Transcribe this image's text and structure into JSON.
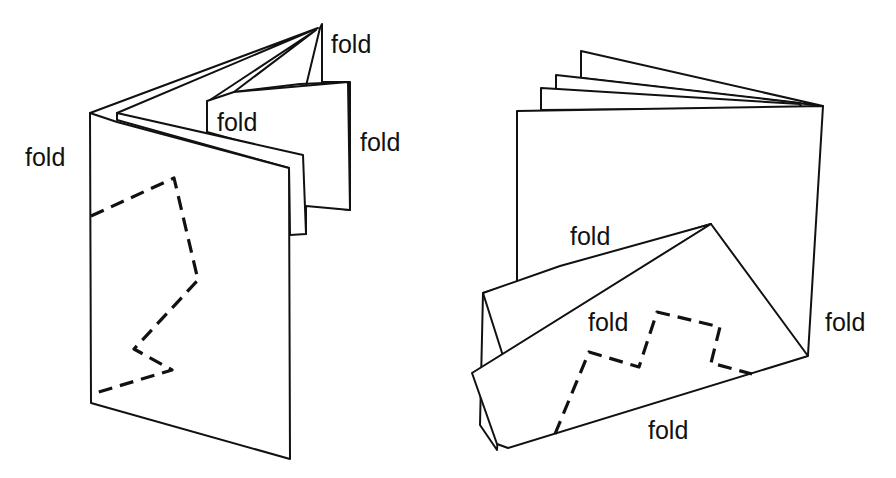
{
  "figure": {
    "left_booklet": {
      "labels": {
        "top_right": "fold",
        "inner": "fold",
        "right": "fold",
        "left": "fold"
      }
    },
    "right_booklet": {
      "labels": {
        "upper": "fold",
        "middle": "fold",
        "right": "fold",
        "bottom": "fold"
      }
    },
    "colors": {
      "ink": "#111111",
      "paper": "#ffffff"
    }
  }
}
